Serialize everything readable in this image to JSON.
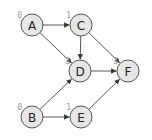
{
  "diagram": {
    "type": "directed-graph",
    "nodes": [
      {
        "id": "A",
        "label": "A",
        "rank": "0",
        "x": 32,
        "y": 25
      },
      {
        "id": "C",
        "label": "C",
        "rank": "1",
        "x": 81,
        "y": 25
      },
      {
        "id": "D",
        "label": "D",
        "rank": "3",
        "x": 80,
        "y": 71
      },
      {
        "id": "F",
        "label": "F",
        "rank": "3",
        "x": 128,
        "y": 71
      },
      {
        "id": "B",
        "label": "B",
        "rank": "0",
        "x": 32,
        "y": 117
      },
      {
        "id": "E",
        "label": "E",
        "rank": "1",
        "x": 81,
        "y": 117
      }
    ],
    "edges": [
      {
        "from": "A",
        "to": "C"
      },
      {
        "from": "A",
        "to": "D"
      },
      {
        "from": "C",
        "to": "D"
      },
      {
        "from": "C",
        "to": "F"
      },
      {
        "from": "D",
        "to": "F"
      },
      {
        "from": "B",
        "to": "D"
      },
      {
        "from": "B",
        "to": "E"
      },
      {
        "from": "E",
        "to": "F"
      }
    ],
    "colors": {
      "node_fill": "#e6e6e6",
      "node_stroke": "#555555",
      "edge": "#444444",
      "rank_text": "#999999"
    }
  }
}
